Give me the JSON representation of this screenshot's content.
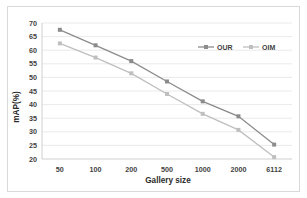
{
  "chart_data": {
    "type": "line",
    "title": "",
    "xlabel": "Gallery size",
    "ylabel": "mAP(%)",
    "categories": [
      "50",
      "100",
      "200",
      "500",
      "1000",
      "2000",
      "6112"
    ],
    "series": [
      {
        "name": "OUR",
        "color": "#8c8c8c",
        "marker": "square",
        "values": [
          67.5,
          61.8,
          56.0,
          48.5,
          41.2,
          35.7,
          25.3
        ]
      },
      {
        "name": "OIM",
        "color": "#bfbfbf",
        "marker": "square",
        "values": [
          62.5,
          57.3,
          51.5,
          43.9,
          36.6,
          30.7,
          20.7
        ]
      }
    ],
    "ylim": [
      20,
      70
    ],
    "ytick_step": 5,
    "yticks": [
      "20",
      "25",
      "30",
      "35",
      "40",
      "45",
      "50",
      "55",
      "60",
      "65",
      "70"
    ],
    "grid": true,
    "legend_position": "top-right-inside",
    "plot_background": "#ffffff",
    "gridline_color": "#e4e4e4",
    "border_color": "#d9d9d9"
  }
}
